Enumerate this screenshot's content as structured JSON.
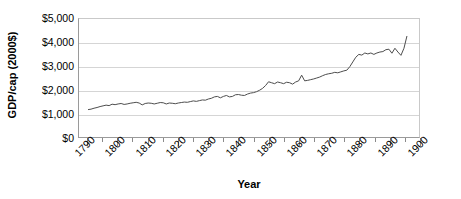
{
  "chart_data": {
    "type": "line",
    "title": "",
    "xlabel": "Year",
    "ylabel": "GDP/cap (2000$)",
    "xlim": [
      1787,
      1900
    ],
    "ylim": [
      0,
      5000
    ],
    "grid": true,
    "legend": false,
    "y_ticks": [
      {
        "value": 5000,
        "label": "$5,000"
      },
      {
        "value": 4000,
        "label": "$4,000"
      },
      {
        "value": 3000,
        "label": "$3,000"
      },
      {
        "value": 2000,
        "label": "$2,000"
      },
      {
        "value": 1000,
        "label": "$1,000"
      },
      {
        "value": 0,
        "label": "$0"
      }
    ],
    "x_ticks": [
      {
        "value": 1790,
        "label": "1790"
      },
      {
        "value": 1800,
        "label": "1800"
      },
      {
        "value": 1810,
        "label": "1810"
      },
      {
        "value": 1820,
        "label": "1820"
      },
      {
        "value": 1830,
        "label": "1830"
      },
      {
        "value": 1840,
        "label": "1840"
      },
      {
        "value": 1850,
        "label": "1850"
      },
      {
        "value": 1860,
        "label": "1860"
      },
      {
        "value": 1870,
        "label": "1870"
      },
      {
        "value": 1880,
        "label": "1880"
      },
      {
        "value": 1890,
        "label": "1890"
      },
      {
        "value": 1900,
        "label": "1900"
      }
    ],
    "x_minor_tick_step": 5,
    "line_color": "#4d4d4d",
    "grid_color": "#d5d5d5",
    "series": [
      {
        "name": "GDP per capita",
        "x": [
          1790,
          1791,
          1792,
          1793,
          1794,
          1795,
          1796,
          1797,
          1798,
          1799,
          1800,
          1801,
          1802,
          1803,
          1804,
          1805,
          1806,
          1807,
          1808,
          1809,
          1810,
          1811,
          1812,
          1813,
          1814,
          1815,
          1816,
          1817,
          1818,
          1819,
          1820,
          1821,
          1822,
          1823,
          1824,
          1825,
          1826,
          1827,
          1828,
          1829,
          1830,
          1831,
          1832,
          1833,
          1834,
          1835,
          1836,
          1837,
          1838,
          1839,
          1840,
          1841,
          1842,
          1843,
          1844,
          1845,
          1846,
          1847,
          1848,
          1849,
          1850,
          1851,
          1852,
          1853,
          1854,
          1855,
          1856,
          1857,
          1858,
          1859,
          1860,
          1861,
          1862,
          1863,
          1864,
          1865,
          1866,
          1867,
          1868,
          1869,
          1870,
          1871,
          1872,
          1873,
          1874,
          1875,
          1876,
          1877,
          1878,
          1879,
          1880,
          1881,
          1882,
          1883,
          1884,
          1885,
          1886,
          1887,
          1888,
          1889,
          1890,
          1891,
          1892,
          1893,
          1894,
          1895,
          1896
        ],
        "values": [
          1160,
          1180,
          1220,
          1250,
          1290,
          1320,
          1350,
          1330,
          1390,
          1370,
          1400,
          1420,
          1380,
          1400,
          1430,
          1450,
          1470,
          1440,
          1360,
          1420,
          1440,
          1430,
          1400,
          1430,
          1460,
          1450,
          1400,
          1440,
          1430,
          1410,
          1440,
          1460,
          1480,
          1470,
          1500,
          1530,
          1510,
          1540,
          1570,
          1560,
          1610,
          1640,
          1700,
          1720,
          1660,
          1720,
          1760,
          1700,
          1720,
          1790,
          1800,
          1770,
          1760,
          1820,
          1860,
          1880,
          1920,
          1980,
          2060,
          2180,
          2340,
          2300,
          2260,
          2330,
          2300,
          2260,
          2320,
          2300,
          2240,
          2330,
          2380,
          2620,
          2380,
          2400,
          2430,
          2460,
          2500,
          2540,
          2600,
          2650,
          2680,
          2700,
          2740,
          2720,
          2760,
          2800,
          2830,
          2980,
          3180,
          3380,
          3500,
          3470,
          3560,
          3520,
          3560,
          3500,
          3560,
          3600,
          3620,
          3700,
          3720,
          3550,
          3760,
          3600,
          3460,
          3760,
          4280
        ]
      }
    ]
  }
}
